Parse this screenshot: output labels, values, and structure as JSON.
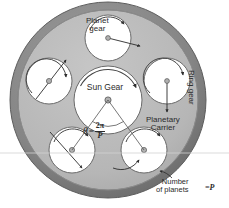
{
  "figure": {
    "background_color": "#ffffff"
  },
  "colors": {
    "ring_gear_band": "#8a8a8a",
    "ring_gear_band_dark": "#6f6f6f",
    "carrier_fill": "#b9b9b9",
    "gear_fill": "#ffffff",
    "outline": "#555555",
    "text": "#2b2b2b",
    "scanline": "#cfcfcf"
  },
  "labels": {
    "planet_gear": "Planet\ngear",
    "planet_gear_line1": "Planet",
    "planet_gear_line2": "gear",
    "sun_gear": "Sun Gear",
    "planetary_carrier_line1": "Planetary",
    "planetary_carrier_line2": "Carrier",
    "ring_gear": "Ring gear",
    "number_of_planets_line1": "Number",
    "number_of_planets_line2": "of planets",
    "number_of_planets_value": "=P"
  },
  "equation": {
    "theta_symbol": "θ",
    "equals": "=",
    "numerator": "2π",
    "denominator": "P",
    "full": "θ = 2π/P"
  },
  "geometry": {
    "center_x": 108,
    "center_y": 100,
    "ring_outer_radius": 98,
    "ring_inner_radius": 90,
    "carrier_radius": 90,
    "sun_radius": 34,
    "planet_radius": 23,
    "planet_orbit_radius": 62,
    "number_of_planets": 5,
    "planet_angles_deg": [
      -90,
      -18,
      54,
      126,
      198
    ],
    "angle_between_planets_deg": 72
  },
  "scanline": {
    "y": 153,
    "visible": true
  }
}
